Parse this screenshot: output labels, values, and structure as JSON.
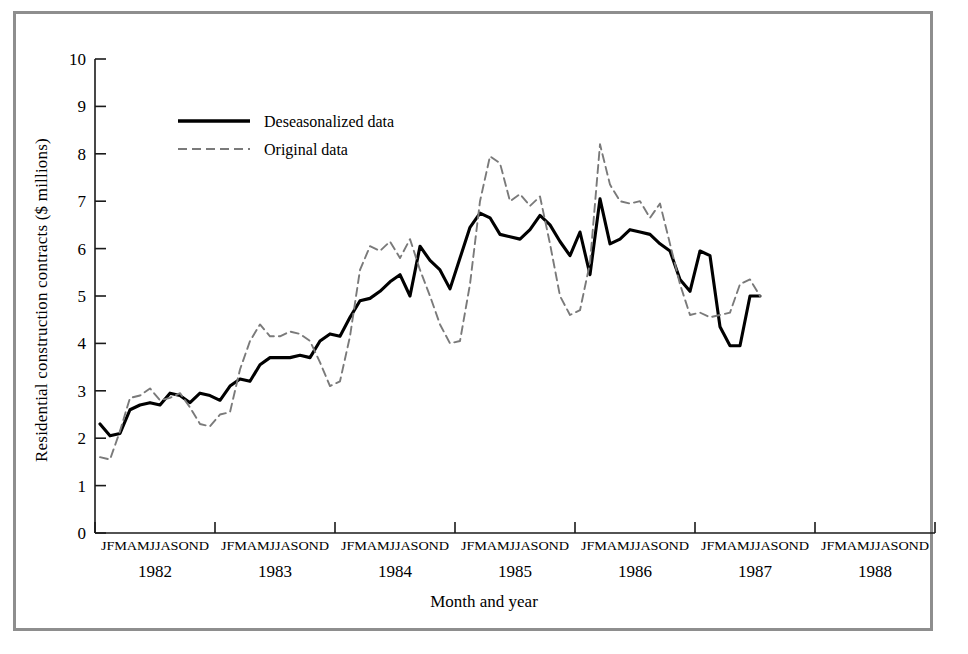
{
  "figure": {
    "frame_color": "#8e8e8e",
    "background": "#ffffff"
  },
  "axis": {
    "y_title": "Residential construction contracts ($ millions)",
    "x_title": "Month and year",
    "y_ticks": [
      "0",
      "1",
      "2",
      "3",
      "4",
      "5",
      "6",
      "7",
      "8",
      "9",
      "10"
    ],
    "month_letters": "JFMAMJJASOND",
    "year_labels": [
      "1982",
      "1983",
      "1984",
      "1985",
      "1986",
      "1987",
      "1988"
    ]
  },
  "legend": {
    "items": [
      {
        "label": "Deseasonalized data",
        "style": "solid",
        "color": "#000000"
      },
      {
        "label": "Original data",
        "style": "dashed",
        "color": "#7a7a7a"
      }
    ]
  },
  "chart_data": {
    "type": "line",
    "title": "",
    "xlabel": "Month and year",
    "ylabel": "Residential construction contracts ($ millions)",
    "ylim": [
      0,
      10
    ],
    "ytick_step": 1,
    "grid": false,
    "legend_position": "upper-left-inside",
    "x_categories": [
      "1982-J",
      "1982-F",
      "1982-M",
      "1982-A",
      "1982-M",
      "1982-J",
      "1982-J",
      "1982-A",
      "1982-S",
      "1982-O",
      "1982-N",
      "1982-D",
      "1983-J",
      "1983-F",
      "1983-M",
      "1983-A",
      "1983-M",
      "1983-J",
      "1983-J",
      "1983-A",
      "1983-S",
      "1983-O",
      "1983-N",
      "1983-D",
      "1984-J",
      "1984-F",
      "1984-M",
      "1984-A",
      "1984-M",
      "1984-J",
      "1984-J",
      "1984-A",
      "1984-S",
      "1984-O",
      "1984-N",
      "1984-D",
      "1985-J",
      "1985-F",
      "1985-M",
      "1985-A",
      "1985-M",
      "1985-J",
      "1985-J",
      "1985-A",
      "1985-S",
      "1985-O",
      "1985-N",
      "1985-D",
      "1986-J",
      "1986-F",
      "1986-M",
      "1986-A",
      "1986-M",
      "1986-J",
      "1986-J",
      "1986-A",
      "1986-S",
      "1986-O",
      "1986-N",
      "1986-D",
      "1987-J",
      "1987-F",
      "1987-M",
      "1987-A",
      "1987-M",
      "1987-J",
      "1987-J"
    ],
    "x_start_year": 1982,
    "x_end_year": 1988,
    "series": [
      {
        "name": "Deseasonalized data",
        "style": "solid",
        "color": "#000000",
        "values": [
          2.3,
          2.05,
          2.1,
          2.6,
          2.7,
          2.75,
          2.7,
          2.95,
          2.9,
          2.75,
          2.95,
          2.9,
          2.8,
          3.1,
          3.25,
          3.2,
          3.55,
          3.7,
          3.7,
          3.7,
          3.75,
          3.7,
          4.05,
          4.2,
          4.15,
          4.55,
          4.9,
          4.95,
          5.1,
          5.3,
          5.45,
          5.0,
          6.05,
          5.75,
          5.55,
          5.15,
          5.8,
          6.45,
          6.75,
          6.65,
          6.3,
          6.25,
          6.2,
          6.4,
          6.7,
          6.5,
          6.15,
          5.85,
          6.35,
          5.45,
          7.05,
          6.1,
          6.2,
          6.4,
          6.35,
          6.3,
          6.1,
          5.95,
          5.35,
          5.1,
          5.95,
          5.85,
          4.35,
          3.95,
          3.95,
          5.0,
          5.0
        ]
      },
      {
        "name": "Original data",
        "style": "dashed",
        "color": "#7a7a7a",
        "values": [
          1.6,
          1.55,
          2.15,
          2.85,
          2.9,
          3.05,
          2.8,
          2.85,
          2.95,
          2.65,
          2.3,
          2.25,
          2.5,
          2.55,
          3.45,
          4.05,
          4.4,
          4.15,
          4.15,
          4.25,
          4.2,
          4.05,
          3.6,
          3.1,
          3.2,
          4.15,
          5.55,
          6.05,
          5.95,
          6.15,
          5.8,
          6.2,
          5.55,
          5.0,
          4.4,
          4.0,
          4.05,
          5.25,
          7.0,
          7.95,
          7.8,
          7.0,
          7.15,
          6.9,
          7.1,
          6.1,
          5.0,
          4.6,
          4.7,
          5.7,
          8.2,
          7.35,
          7.0,
          6.95,
          7.0,
          6.65,
          6.95,
          6.1,
          5.25,
          4.6,
          4.65,
          4.55,
          4.6,
          4.65,
          5.25,
          5.35,
          5.0
        ]
      }
    ]
  }
}
